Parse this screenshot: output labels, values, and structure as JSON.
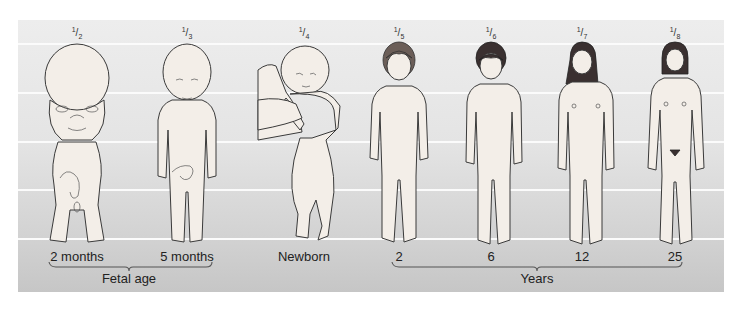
{
  "figures": [
    {
      "id": "2-months",
      "ratio_num": "1",
      "ratio_den": "2",
      "age_label": "2 months",
      "x": 77
    },
    {
      "id": "5-months",
      "ratio_num": "1",
      "ratio_den": "3",
      "age_label": "5 months",
      "x": 187
    },
    {
      "id": "newborn",
      "ratio_num": "1",
      "ratio_den": "4",
      "age_label": "Newborn",
      "x": 304
    },
    {
      "id": "age-2",
      "ratio_num": "1",
      "ratio_den": "5",
      "age_label": "2",
      "x": 399
    },
    {
      "id": "age-6",
      "ratio_num": "1",
      "ratio_den": "6",
      "age_label": "6",
      "x": 491
    },
    {
      "id": "age-12",
      "ratio_num": "1",
      "ratio_den": "7",
      "age_label": "12",
      "x": 582
    },
    {
      "id": "age-25",
      "ratio_num": "1",
      "ratio_den": "8",
      "age_label": "25",
      "x": 675
    }
  ],
  "groups": [
    {
      "label": "Fetal age",
      "from": "2 months",
      "to": "5 months"
    },
    {
      "label": "Years",
      "from": "2",
      "to": "25"
    }
  ],
  "colors": {
    "background_top": "#ededed",
    "background_bottom": "#c6c6c6",
    "grid_lines": "#fbfbfb",
    "skin": "#f3eee8",
    "outline": "#3a3a3a"
  }
}
